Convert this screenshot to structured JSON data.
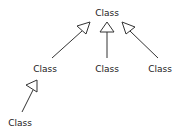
{
  "diagram": {
    "type": "uml-inheritance",
    "nodes": [
      {
        "id": "top",
        "label": "Class"
      },
      {
        "id": "mid-left",
        "label": "Class"
      },
      {
        "id": "mid-center",
        "label": "Class"
      },
      {
        "id": "mid-right",
        "label": "Class"
      },
      {
        "id": "bottom-left",
        "label": "Class"
      }
    ],
    "edges": [
      {
        "from": "mid-left",
        "to": "top",
        "arrow": "hollow-triangle"
      },
      {
        "from": "mid-center",
        "to": "top",
        "arrow": "hollow-triangle"
      },
      {
        "from": "mid-right",
        "to": "top",
        "arrow": "hollow-triangle"
      },
      {
        "from": "bottom-left",
        "to": "mid-left",
        "arrow": "hollow-triangle"
      }
    ]
  }
}
